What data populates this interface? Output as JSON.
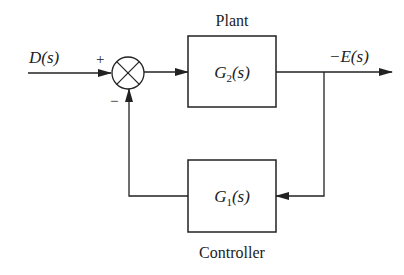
{
  "diagram": {
    "type": "feedback-block-diagram",
    "input": {
      "label": "D(s)"
    },
    "output": {
      "label": "−E(s)"
    },
    "summing_junction": {
      "plus_sign": "+",
      "minus_sign": "−"
    },
    "plant": {
      "title": "Plant",
      "transfer_function": "G",
      "subscript": "2",
      "arg": "(s)"
    },
    "controller": {
      "title": "Controller",
      "transfer_function": "G",
      "subscript": "1",
      "arg": "(s)"
    },
    "colors": {
      "line": "#222222",
      "background": "#ffffff"
    }
  }
}
